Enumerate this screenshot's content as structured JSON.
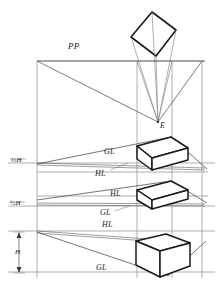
{
  "figure": {
    "type": "technical-perspective-construction-drawing",
    "title_label": "PP",
    "colors": {
      "ink": "#1a1a1a",
      "construction": "#6f6f6f",
      "thin": "#8a8a8a",
      "paper": "#ffffff"
    },
    "labels": {
      "picture_plane": "PP",
      "eye_point": "E",
      "ground_line": "GL",
      "horizon_line": "HL",
      "height_dim": "H",
      "station_high": "⅓H",
      "station_mid": "½H"
    },
    "annotations": [
      {
        "id": "pp",
        "text": "PP",
        "x": 68,
        "y": 45,
        "cls": "lbl-pp"
      },
      {
        "id": "eye",
        "text": "E",
        "x": 160,
        "y": 124,
        "cls": "lbl-e"
      },
      {
        "id": "gl-1",
        "text": "GL",
        "x": 104,
        "y": 152,
        "cls": "lbl-gl"
      },
      {
        "id": "hl-1",
        "text": "HL",
        "x": 95,
        "y": 174,
        "cls": "lbl-hl"
      },
      {
        "id": "frac-1",
        "text": "⅓H",
        "x": 11,
        "y": 162,
        "cls": "lbl-frac"
      },
      {
        "id": "hl-2",
        "text": "HL",
        "x": 110,
        "y": 194,
        "cls": "lbl-hl"
      },
      {
        "id": "frac-2",
        "text": "½H",
        "x": 10,
        "y": 205,
        "cls": "lbl-frac"
      },
      {
        "id": "gl-2",
        "text": "GL",
        "x": 100,
        "y": 213,
        "cls": "lbl-gl"
      },
      {
        "id": "hl-3",
        "text": "HL",
        "x": 102,
        "y": 224,
        "cls": "lbl-hl"
      },
      {
        "id": "h-dim",
        "text": "H",
        "x": 15,
        "y": 252,
        "cls": "lbl-h"
      },
      {
        "id": "gl-3",
        "text": "GL",
        "x": 96,
        "y": 268,
        "cls": "lbl-gl"
      }
    ],
    "geometry": {
      "picture_plane_y": 61,
      "eye_point": {
        "x": 158,
        "y": 122
      },
      "verticals_x": [
        37,
        137,
        172,
        202
      ],
      "horizon_lines_y": [
        163,
        206,
        231
      ],
      "ground_lines_y": [
        172,
        196,
        272
      ],
      "views": [
        {
          "name": "plan-view-rotated-square",
          "position": "top"
        },
        {
          "name": "perspective-cube-above-horizon",
          "position": "first"
        },
        {
          "name": "perspective-cube-at-horizon",
          "position": "second"
        },
        {
          "name": "perspective-cube-below-horizon",
          "position": "third"
        }
      ]
    }
  }
}
